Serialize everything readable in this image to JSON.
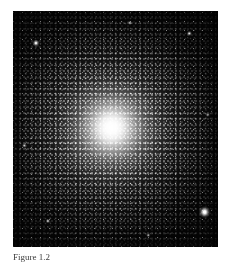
{
  "figure": {
    "panel": {
      "name": "globular-cluster-image",
      "subject": "globular star cluster",
      "background_color": "#050505",
      "page_background_color": "#ffffff",
      "core_color": "#ffffff",
      "halo_color": "#b4b4b4",
      "core_center_x_pct": 48,
      "core_center_y_pct": 50,
      "alt_text": "Dense spherical globular cluster of stars with a bright saturated white core fading into a granular halo against a black sky"
    },
    "caption": {
      "label": "Figure 1.2",
      "text": ""
    },
    "bright_stars": [
      {
        "name": "field-star-lower-right",
        "x_pct": 93.5,
        "y_pct": 85.2,
        "radius": 2.4,
        "brightness": 1.0
      },
      {
        "name": "field-star-upper-left",
        "x_pct": 11.2,
        "y_pct": 13.6,
        "radius": 1.5,
        "brightness": 0.75
      },
      {
        "name": "field-star-upper-right",
        "x_pct": 86.0,
        "y_pct": 9.5,
        "radius": 1.1,
        "brightness": 0.6
      },
      {
        "name": "field-star-left-mid",
        "x_pct": 5.5,
        "y_pct": 57.0,
        "radius": 1.0,
        "brightness": 0.55
      },
      {
        "name": "field-star-lower-left",
        "x_pct": 17.0,
        "y_pct": 89.0,
        "radius": 1.0,
        "brightness": 0.5
      },
      {
        "name": "field-star-top-mid",
        "x_pct": 57.0,
        "y_pct": 5.0,
        "radius": 0.9,
        "brightness": 0.5
      },
      {
        "name": "field-star-right-mid",
        "x_pct": 95.0,
        "y_pct": 44.0,
        "radius": 0.9,
        "brightness": 0.45
      },
      {
        "name": "field-star-bottom-mid",
        "x_pct": 66.0,
        "y_pct": 95.0,
        "radius": 0.9,
        "brightness": 0.45
      }
    ]
  }
}
